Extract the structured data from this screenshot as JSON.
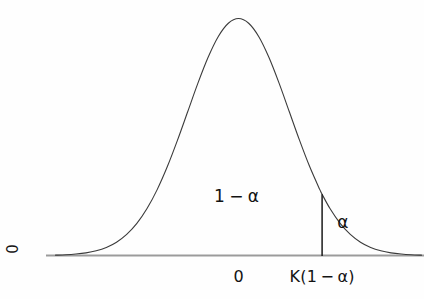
{
  "figure": {
    "width": 424,
    "height": 299,
    "background_color": "#fefefe"
  },
  "axis": {
    "baseline_color": "#9b9b9b",
    "baseline_y": 255.5,
    "baseline_x_start": 46,
    "baseline_x_end": 424,
    "y_origin_label": "0"
  },
  "curve": {
    "color": "#3b3b3b",
    "stroke_width": 1.1,
    "peak_x": 235,
    "peak_y": 6
  },
  "critical_line": {
    "color": "#1a1a1a",
    "stroke_width": 1.5,
    "x": 332,
    "y_top": 186,
    "y_bottom": 256
  },
  "labels": {
    "confidence_region": "1 − α",
    "tail_region": "α",
    "x_tick_center": "0",
    "x_tick_critical": "K(1 − α)"
  },
  "chart_data": {
    "type": "area",
    "xlabel": "",
    "ylabel": "0",
    "grid": false,
    "legend": null,
    "x_tick_labels": [
      "0",
      "K(1 − α)"
    ],
    "x_tick_values": [
      0,
      1.645
    ],
    "y_tick_labels": [
      "0"
    ],
    "xlim": [
      -3.65,
      3.65
    ],
    "ylim": [
      0,
      0.42
    ],
    "annotations": [
      {
        "text": "1 − α",
        "x": -0.03,
        "y": 0.1,
        "meaning": "area left of critical value"
      },
      {
        "text": "α",
        "x": 2.05,
        "y": 0.055,
        "meaning": "upper tail area"
      },
      {
        "text": "K(1 − α)",
        "x": 1.645,
        "y": 0,
        "meaning": "critical value on x axis"
      }
    ],
    "vertical_lines": [
      {
        "x": 1.645,
        "label": "K(1 − α)",
        "y_from": 0,
        "y_to": 0.103
      }
    ],
    "series": [
      {
        "name": "standard normal pdf",
        "x": [
          -3.6,
          -3.4,
          -3.2,
          -3.0,
          -2.8,
          -2.6,
          -2.4,
          -2.2,
          -2.0,
          -1.8,
          -1.6,
          -1.4,
          -1.2,
          -1.0,
          -0.8,
          -0.6,
          -0.4,
          -0.2,
          0.0,
          0.2,
          0.4,
          0.6,
          0.8,
          1.0,
          1.2,
          1.4,
          1.6,
          1.645,
          1.8,
          2.0,
          2.2,
          2.4,
          2.6,
          2.8,
          3.0,
          3.2,
          3.4,
          3.6
        ],
        "values": [
          0.0006,
          0.0012,
          0.0024,
          0.0044,
          0.0079,
          0.0136,
          0.0224,
          0.0355,
          0.054,
          0.079,
          0.1109,
          0.1497,
          0.1942,
          0.242,
          0.2897,
          0.3332,
          0.3683,
          0.391,
          0.3989,
          0.391,
          0.3683,
          0.3332,
          0.2897,
          0.242,
          0.1942,
          0.1497,
          0.1109,
          0.1031,
          0.079,
          0.054,
          0.0355,
          0.0224,
          0.0136,
          0.0079,
          0.0044,
          0.0024,
          0.0012,
          0.0006
        ]
      }
    ]
  }
}
